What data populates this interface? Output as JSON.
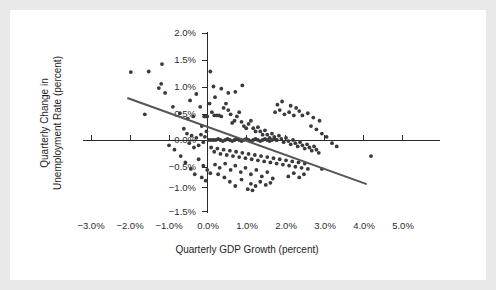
{
  "figure": {
    "background_color": "#e9e9e9",
    "card_color": "#ffffff",
    "point_color": "#3a3a3e",
    "line_color": "#555558",
    "axis_color": "#2a2a2a"
  },
  "chart_data": {
    "type": "scatter",
    "title": "",
    "xlabel": "Quarterly GDP Growth (percent)",
    "ylabel": "Quarterly Change in Unemployment Rate (percent)",
    "xlim": [
      -3.5,
      5.5
    ],
    "ylim": [
      -1.75,
      2.25
    ],
    "xticks": [
      -3.0,
      -2.0,
      -1.0,
      0.0,
      1.0,
      2.0,
      3.0,
      4.0,
      5.0
    ],
    "xticklabels": [
      "−3.0%",
      "−2.0%",
      "−1.0%",
      "0.0%",
      "1.0%",
      "2.0%",
      "3.0%",
      "4.0%",
      "5.0%"
    ],
    "yticks": [
      2.0,
      1.5,
      1.0,
      0.5,
      0.0,
      -0.5,
      -1.0,
      -1.5
    ],
    "yticklabels": [
      "2.0%",
      "1.5%",
      "1.0%",
      "0.5%",
      "0.0%",
      "−0.5%",
      "−1.0%",
      "−1.5%"
    ],
    "grid": false,
    "legend": null,
    "axes_style": "spines-at-zero",
    "trendline": {
      "type": "linear-fit",
      "x_start": -2.05,
      "y_start": 0.78,
      "x_end": 4.05,
      "y_end": -0.82
    },
    "series": [
      {
        "name": "Quarterly observations",
        "marker": "circle",
        "points": [
          [
            -1.98,
            1.27
          ],
          [
            -1.52,
            1.28
          ],
          [
            -1.18,
            1.42
          ],
          [
            -1.2,
            1.05
          ],
          [
            -1.1,
            0.88
          ],
          [
            -1.26,
            0.97
          ],
          [
            -0.9,
            0.62
          ],
          [
            -1.62,
            0.48
          ],
          [
            -0.72,
            0.5
          ],
          [
            -0.52,
            0.4
          ],
          [
            -0.62,
            0.21
          ],
          [
            -0.38,
            0.44
          ],
          [
            -0.2,
            0.62
          ],
          [
            -0.16,
            0.26
          ],
          [
            -0.1,
            0.44
          ],
          [
            -0.06,
            0.44
          ],
          [
            -0.02,
            0.44
          ],
          [
            0.06,
            1.28
          ],
          [
            0.14,
            1.0
          ],
          [
            0.18,
            0.8
          ],
          [
            0.04,
            0.68
          ],
          [
            0.1,
            0.52
          ],
          [
            0.16,
            0.46
          ],
          [
            0.22,
            0.46
          ],
          [
            0.28,
            0.46
          ],
          [
            0.34,
            0.44
          ],
          [
            0.4,
            0.6
          ],
          [
            0.46,
            0.68
          ],
          [
            0.52,
            0.56
          ],
          [
            0.58,
            0.48
          ],
          [
            0.62,
            0.32
          ],
          [
            0.68,
            0.36
          ],
          [
            0.74,
            0.44
          ],
          [
            0.8,
            0.52
          ],
          [
            0.86,
            0.34
          ],
          [
            0.92,
            0.26
          ],
          [
            0.98,
            0.22
          ],
          [
            1.04,
            0.3
          ],
          [
            1.1,
            0.36
          ],
          [
            1.16,
            0.22
          ],
          [
            1.22,
            0.16
          ],
          [
            1.28,
            0.24
          ],
          [
            1.34,
            0.16
          ],
          [
            1.4,
            0.1
          ],
          [
            1.46,
            0.18
          ],
          [
            1.52,
            0.1
          ],
          [
            1.58,
            0.04
          ],
          [
            1.64,
            0.12
          ],
          [
            1.7,
            0.06
          ],
          [
            1.76,
            0.0
          ],
          [
            1.82,
            0.08
          ],
          [
            1.88,
            0.02
          ],
          [
            1.94,
            -0.04
          ],
          [
            2.0,
            0.04
          ],
          [
            2.06,
            -0.02
          ],
          [
            2.12,
            -0.08
          ],
          [
            2.18,
            0.0
          ],
          [
            2.24,
            -0.06
          ],
          [
            2.3,
            -0.12
          ],
          [
            2.36,
            -0.04
          ],
          [
            2.42,
            -0.1
          ],
          [
            2.48,
            -0.16
          ],
          [
            2.54,
            -0.08
          ],
          [
            2.6,
            -0.14
          ],
          [
            2.66,
            -0.2
          ],
          [
            2.72,
            -0.12
          ],
          [
            2.78,
            -0.18
          ],
          [
            2.84,
            -0.24
          ],
          [
            0.02,
            0.0
          ],
          [
            0.08,
            0.0
          ],
          [
            0.14,
            0.0
          ],
          [
            0.2,
            0.0
          ],
          [
            0.26,
            0.02
          ],
          [
            0.32,
            0.0
          ],
          [
            0.38,
            -0.02
          ],
          [
            0.44,
            0.0
          ],
          [
            0.5,
            0.02
          ],
          [
            0.56,
            0.0
          ],
          [
            0.62,
            -0.02
          ],
          [
            0.68,
            0.0
          ],
          [
            0.74,
            0.02
          ],
          [
            0.8,
            0.0
          ],
          [
            0.86,
            -0.02
          ],
          [
            0.92,
            0.0
          ],
          [
            0.98,
            0.02
          ],
          [
            1.04,
            0.0
          ],
          [
            1.1,
            -0.02
          ],
          [
            1.16,
            0.0
          ],
          [
            1.22,
            0.02
          ],
          [
            1.28,
            0.0
          ],
          [
            1.34,
            -0.02
          ],
          [
            1.4,
            0.0
          ],
          [
            1.46,
            0.02
          ],
          [
            1.52,
            0.0
          ],
          [
            1.58,
            -0.02
          ],
          [
            1.64,
            0.0
          ],
          [
            1.7,
            0.02
          ],
          [
            1.76,
            0.0
          ],
          [
            -0.04,
            0.16
          ],
          [
            -0.08,
            0.06
          ],
          [
            -0.12,
            -0.04
          ],
          [
            -0.18,
            0.1
          ],
          [
            -0.24,
            -0.1
          ],
          [
            -0.3,
            0.04
          ],
          [
            -0.36,
            -0.14
          ],
          [
            -0.42,
            0.08
          ],
          [
            -0.48,
            -0.06
          ],
          [
            -0.54,
            0.12
          ],
          [
            0.08,
            -0.14
          ],
          [
            0.16,
            -0.22
          ],
          [
            0.24,
            -0.16
          ],
          [
            0.32,
            -0.26
          ],
          [
            0.4,
            -0.18
          ],
          [
            0.48,
            -0.28
          ],
          [
            0.56,
            -0.2
          ],
          [
            0.64,
            -0.3
          ],
          [
            0.72,
            -0.22
          ],
          [
            0.8,
            -0.32
          ],
          [
            0.88,
            -0.24
          ],
          [
            0.96,
            -0.34
          ],
          [
            1.04,
            -0.26
          ],
          [
            1.12,
            -0.36
          ],
          [
            1.2,
            -0.28
          ],
          [
            1.28,
            -0.38
          ],
          [
            1.36,
            -0.3
          ],
          [
            1.44,
            -0.4
          ],
          [
            1.52,
            -0.32
          ],
          [
            1.6,
            -0.42
          ],
          [
            1.68,
            -0.34
          ],
          [
            1.76,
            -0.44
          ],
          [
            1.84,
            -0.36
          ],
          [
            1.92,
            -0.46
          ],
          [
            2.0,
            -0.38
          ],
          [
            2.08,
            -0.48
          ],
          [
            2.16,
            -0.4
          ],
          [
            2.24,
            -0.5
          ],
          [
            2.32,
            -0.42
          ],
          [
            2.4,
            -0.52
          ],
          [
            2.48,
            -0.44
          ],
          [
            2.56,
            -0.54
          ],
          [
            0.18,
            -0.46
          ],
          [
            0.3,
            -0.52
          ],
          [
            0.44,
            -0.44
          ],
          [
            0.58,
            -0.56
          ],
          [
            0.7,
            -0.48
          ],
          [
            0.84,
            -0.6
          ],
          [
            0.96,
            -0.52
          ],
          [
            1.1,
            -0.64
          ],
          [
            1.24,
            -0.56
          ],
          [
            1.38,
            -0.68
          ],
          [
            1.52,
            -0.6
          ],
          [
            1.66,
            -0.72
          ],
          [
            1.1,
            -0.82
          ],
          [
            1.22,
            -0.86
          ],
          [
            1.34,
            -0.78
          ],
          [
            0.86,
            -0.74
          ],
          [
            1.48,
            -0.84
          ],
          [
            1.6,
            -0.8
          ],
          [
            1.02,
            -0.92
          ],
          [
            1.14,
            -0.94
          ],
          [
            0.42,
            -0.7
          ],
          [
            0.26,
            -0.64
          ],
          [
            0.56,
            -0.78
          ],
          [
            0.7,
            -0.86
          ],
          [
            2.64,
            0.26
          ],
          [
            2.78,
            0.2
          ],
          [
            2.92,
            0.12
          ],
          [
            3.04,
            0.06
          ],
          [
            2.7,
            0.42
          ],
          [
            2.86,
            0.36
          ],
          [
            3.18,
            -0.06
          ],
          [
            3.3,
            -0.12
          ],
          [
            2.56,
            0.5
          ],
          [
            2.42,
            0.46
          ],
          [
            2.34,
            0.54
          ],
          [
            2.2,
            0.46
          ],
          [
            2.08,
            0.52
          ],
          [
            1.96,
            0.48
          ],
          [
            1.84,
            0.56
          ],
          [
            1.72,
            0.52
          ],
          [
            2.12,
            0.64
          ],
          [
            2.26,
            0.6
          ],
          [
            1.9,
            0.72
          ],
          [
            1.78,
            0.66
          ],
          [
            4.18,
            -0.3
          ],
          [
            2.92,
            -0.54
          ],
          [
            0.88,
            1.02
          ],
          [
            0.7,
            0.9
          ],
          [
            -0.46,
            0.74
          ],
          [
            -0.3,
            0.86
          ],
          [
            0.52,
            0.88
          ],
          [
            0.34,
            0.96
          ],
          [
            -0.7,
            -0.3
          ],
          [
            -0.58,
            -0.42
          ],
          [
            -0.86,
            -0.18
          ],
          [
            -1.0,
            -0.1
          ],
          [
            -0.24,
            -0.36
          ],
          [
            -0.12,
            -0.48
          ],
          [
            -0.02,
            -0.56
          ],
          [
            0.06,
            -0.62
          ],
          [
            -0.44,
            -0.54
          ],
          [
            -0.34,
            -0.64
          ],
          [
            -0.16,
            -0.7
          ],
          [
            -0.06,
            -0.76
          ],
          [
            2.46,
            -0.64
          ],
          [
            2.34,
            -0.7
          ],
          [
            2.2,
            -0.62
          ],
          [
            2.06,
            -0.68
          ]
        ]
      }
    ]
  }
}
